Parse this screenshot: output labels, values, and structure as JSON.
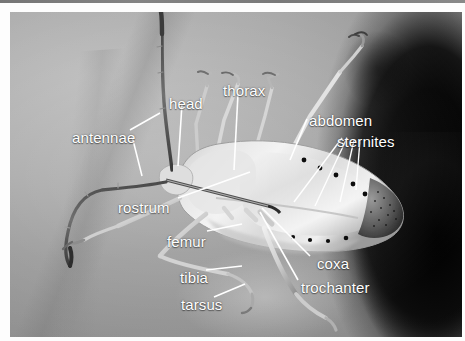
{
  "figure": {
    "kind": "photograph",
    "colorspace": "grayscale",
    "width": 465,
    "height": 341,
    "label_color": "#ffffff",
    "background_color": "#9a9a9a",
    "dark_mass_color": "#000000"
  },
  "labels": [
    {
      "id": "antennae",
      "text": "antennae",
      "x": 62,
      "y": 118
    },
    {
      "id": "head",
      "text": "head",
      "x": 159,
      "y": 84
    },
    {
      "id": "thorax",
      "text": "thorax",
      "x": 213,
      "y": 71
    },
    {
      "id": "abdomen",
      "text": "abdomen",
      "x": 299,
      "y": 101
    },
    {
      "id": "sternites",
      "text": "sternites",
      "x": 327,
      "y": 122
    },
    {
      "id": "rostrum",
      "text": "rostrum",
      "x": 108,
      "y": 188
    },
    {
      "id": "femur",
      "text": "femur",
      "x": 157,
      "y": 222
    },
    {
      "id": "coxa",
      "text": "coxa",
      "x": 307,
      "y": 244
    },
    {
      "id": "trochanter",
      "text": "trochanter",
      "x": 291,
      "y": 268
    },
    {
      "id": "tibia",
      "text": "tibia",
      "x": 170,
      "y": 258
    },
    {
      "id": "tarsus",
      "text": "tarsus",
      "x": 171,
      "y": 285
    }
  ],
  "anatomy_terms": [
    "antennae",
    "head",
    "thorax",
    "abdomen",
    "sternites",
    "rostrum",
    "femur",
    "coxa",
    "trochanter",
    "tibia",
    "tarsus"
  ]
}
